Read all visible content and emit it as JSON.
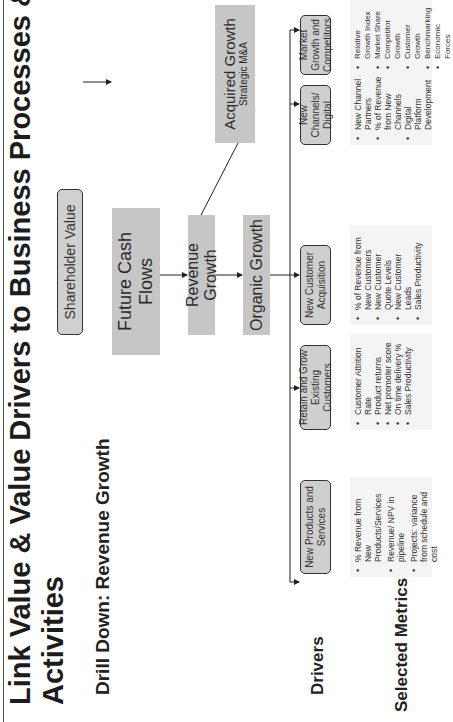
{
  "slide": {
    "title": "Link Value & Value Drivers to Business Processes &",
    "title_line2": "Activities",
    "subtitle": "Drill Down: Revenue Growth"
  },
  "hierarchy": {
    "shareholder_value": "Shareholder Value",
    "future_cash_flows": "Future Cash Flows",
    "revenue_growth": "Revenue Growth",
    "organic_growth": "Organic Growth",
    "acquired_growth": "Acquired Growth",
    "acquired_growth_sub": "Strategic M&A"
  },
  "sections": {
    "drivers_label": "Drivers",
    "metrics_label": "Selected Metrics"
  },
  "drivers": [
    {
      "label": "New Products and Services",
      "metrics": [
        "% Revenue from New Products/Services",
        "Revenue/ NPV in pipeline",
        "Projects: variance from schedule and cost"
      ]
    },
    {
      "label": "Retain and Grow Existing Customers",
      "metrics": [
        "Customer Attrition Rate",
        "Product returns",
        "Net promoter score",
        "On time delivery %",
        "Sales Productivity"
      ]
    },
    {
      "label": "New Customer Acquisition",
      "metrics": [
        "% of Revenue from New Customers",
        "New Customer Quote Levels",
        "New Customer Leads",
        "Sales Productivity"
      ]
    },
    {
      "label": "New Channels/ Digital",
      "metrics": [
        "New Channel Partners",
        "% of Revenue from New Channels",
        "Digital Platform Development"
      ]
    },
    {
      "label": "Market Growth and Competitors",
      "metrics": [
        "Relative Growth Index",
        "Market Share",
        "Competitor Growth",
        "Customer Growth",
        "Benchmarking",
        "Economic Forces"
      ]
    }
  ],
  "colors": {
    "box_fill": "#c6c6c6",
    "driver_fill": "#cfcfcf",
    "metrics_fill": "#f4f4f4",
    "text": "#1a1a1a"
  }
}
